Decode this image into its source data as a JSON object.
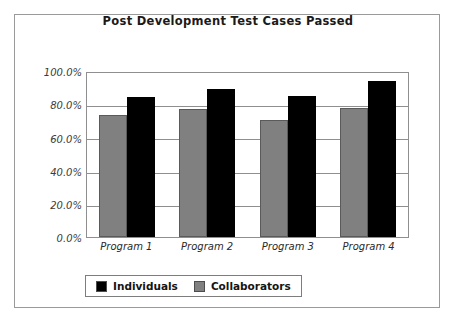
{
  "chart_data": {
    "type": "bar",
    "title": "Post Development Test Cases Passed",
    "xlabel": "",
    "ylabel": "",
    "categories": [
      "Program 1",
      "Program 2",
      "Program 3",
      "Program 4"
    ],
    "series": [
      {
        "name": "Individuals",
        "color": "#000000",
        "values": [
          85.5,
          90.0,
          86.0,
          95.0
        ]
      },
      {
        "name": "Collaborators",
        "color": "#808080",
        "values": [
          74.7,
          78.0,
          71.5,
          78.5
        ]
      }
    ],
    "ylim": [
      0,
      100
    ],
    "y_ticks": [
      0,
      20,
      40,
      60,
      80,
      100
    ],
    "y_tick_labels": [
      "0.0%",
      "20.0%",
      "40.0%",
      "60.0%",
      "80.0%",
      "100.0%"
    ],
    "grid": true,
    "legend_position": "bottom",
    "bar_order_in_group": [
      "Collaborators",
      "Individuals"
    ]
  },
  "axis": {
    "y_labels": [
      "100.0%",
      "80.0%",
      "60.0%",
      "40.0%",
      "20.0%",
      "0.0%"
    ],
    "x_labels": [
      "Program 1",
      "Program 2",
      "Program 3",
      "Program 4"
    ]
  },
  "legend": {
    "items": [
      {
        "label": "Individuals",
        "color": "#000000"
      },
      {
        "label": "Collaborators",
        "color": "#808080"
      }
    ]
  }
}
